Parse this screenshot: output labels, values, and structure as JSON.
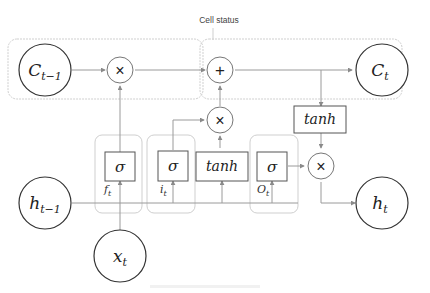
{
  "title": "Cell status",
  "caption": "",
  "nodes": {
    "c_prev": {
      "base": "C",
      "sub": "t−1"
    },
    "c_t": {
      "base": "C",
      "sub": "t"
    },
    "h_prev": {
      "base": "h",
      "sub": "t−1"
    },
    "h_t": {
      "base": "h",
      "sub": "t"
    },
    "x_t": {
      "base": "x",
      "sub": "t"
    }
  },
  "operators": {
    "mul_forget": "×",
    "add_cell": "+",
    "mul_input": "×",
    "mul_output": "×"
  },
  "gates": {
    "forget": {
      "fn": "σ",
      "label_base": "f",
      "label_sub": "t"
    },
    "input": {
      "fn": "σ",
      "label_base": "i",
      "label_sub": "t"
    },
    "candidate": {
      "fn": "tanh"
    },
    "output": {
      "fn": "σ",
      "label_base": "O",
      "label_sub": "t"
    },
    "cell_tanh": {
      "fn": "tanh"
    }
  },
  "colors": {
    "node_stroke": "#333333",
    "line": "#9a9a9a",
    "group_border": "#cfcfcf",
    "box_stroke": "#555555"
  }
}
